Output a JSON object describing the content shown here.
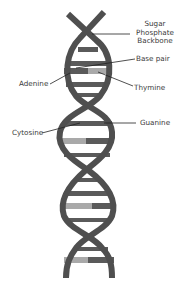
{
  "diagram": {
    "colors": {
      "background": "#ffffff",
      "backbone": "#4f4f4f",
      "rung_dark": "#5a5a5a",
      "rung_light": "#a9a9a9",
      "leader_line": "#222222",
      "label_text": "#3a3a3a"
    },
    "labels": {
      "backbone_line1": "Sugar",
      "backbone_line2": "Phosphate",
      "backbone_line3": "Backbone",
      "base_pair": "Base pair",
      "adenine": "Adenine",
      "thymine": "Thymine",
      "cytosine": "Cytosine",
      "guanine": "Guanine"
    }
  }
}
